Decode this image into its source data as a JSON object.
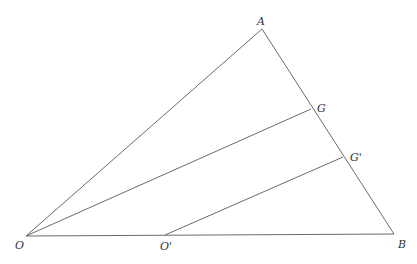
{
  "diagram": {
    "type": "geometry-triangle",
    "points": {
      "O": {
        "label": "O",
        "x": 26,
        "y": 236
      },
      "A": {
        "label": "A",
        "x": 262,
        "y": 29
      },
      "B": {
        "label": "B",
        "x": 394,
        "y": 234
      },
      "G": {
        "label": "G",
        "x": 311,
        "y": 109
      },
      "G_prime": {
        "label": "G'",
        "x": 343,
        "y": 157
      },
      "O_prime": {
        "label": "O'",
        "x": 165,
        "y": 236
      }
    },
    "segments": [
      {
        "from": "O",
        "to": "A"
      },
      {
        "from": "A",
        "to": "B"
      },
      {
        "from": "O",
        "to": "B"
      },
      {
        "from": "O",
        "to": "G"
      },
      {
        "from": "O'",
        "to": "G'"
      }
    ],
    "colors": {
      "line": "#6b6b6b",
      "label": "#333333",
      "background": "#ffffff"
    }
  }
}
